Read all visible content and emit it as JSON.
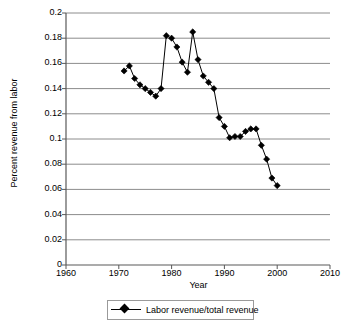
{
  "chart_data": {
    "type": "line",
    "title": "",
    "xlabel": "Year",
    "ylabel": "Percent revenue from labor",
    "xlim": [
      1960,
      2010
    ],
    "ylim": [
      0,
      0.2
    ],
    "xticks": [
      1960,
      1970,
      1980,
      1990,
      2000,
      2010
    ],
    "xtick_labels": [
      "1960",
      "1970",
      "1980",
      "1990",
      "2000",
      "2010"
    ],
    "yticks": [
      0,
      0.02,
      0.04,
      0.06,
      0.08,
      0.1,
      0.12,
      0.14,
      0.16,
      0.18,
      0.2
    ],
    "ytick_labels": [
      "0",
      "0.02",
      "0.04",
      "0.06",
      "0.08",
      "0.1",
      "0.12",
      "0.14",
      "0.16",
      "0.18",
      "0.2"
    ],
    "grid": "horizontal",
    "legend_position": "bottom",
    "marker": "diamond",
    "series": [
      {
        "name": "Labor revenue/total revenue",
        "color": "#000000",
        "x": [
          1971,
          1972,
          1973,
          1974,
          1975,
          1976,
          1977,
          1978,
          1979,
          1980,
          1981,
          1982,
          1983,
          1984,
          1985,
          1986,
          1987,
          1988,
          1989,
          1990,
          1991,
          1992,
          1993,
          1994,
          1995,
          1996,
          1997,
          1998,
          1999,
          2000
        ],
        "values": [
          0.154,
          0.158,
          0.148,
          0.143,
          0.14,
          0.137,
          0.134,
          0.14,
          0.182,
          0.18,
          0.173,
          0.161,
          0.153,
          0.185,
          0.163,
          0.15,
          0.145,
          0.14,
          0.117,
          0.11,
          0.101,
          0.102,
          0.102,
          0.106,
          0.108,
          0.108,
          0.095,
          0.084,
          0.069,
          0.063
        ]
      }
    ]
  },
  "legend": {
    "entries": [
      {
        "label": "Labor revenue/total revenue"
      }
    ]
  },
  "axes": {
    "x_title": "Year",
    "y_title": "Percent revenue from labor"
  }
}
